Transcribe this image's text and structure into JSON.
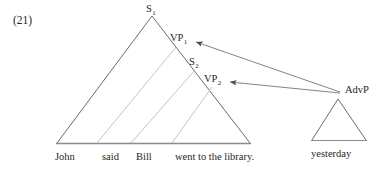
{
  "figure": {
    "example_number": "(21)",
    "colors": {
      "outline": "#5a5a5a",
      "inner_line": "#b9b9b9",
      "baseline": "#8c8c8c",
      "arrow": "#6e6e6e",
      "text": "#262626",
      "background": "#ffffff"
    }
  },
  "main_tree": {
    "nodes": [
      {
        "id": "s1",
        "base": "S",
        "subscript": "1"
      },
      {
        "id": "vp1",
        "base": "VP",
        "subscript": "1"
      },
      {
        "id": "s2",
        "base": "S",
        "subscript": "2"
      },
      {
        "id": "vp2",
        "base": "VP",
        "subscript": "2"
      }
    ],
    "terminals": [
      {
        "id": "w1",
        "text": "John"
      },
      {
        "id": "w2",
        "text": "said"
      },
      {
        "id": "w3",
        "text": "Bill"
      },
      {
        "id": "w4",
        "text": "went to the library."
      }
    ],
    "terminal_string": "John said Bill went to the library."
  },
  "adjunct_tree": {
    "node": {
      "id": "advp",
      "base": "AdvP",
      "subscript": ""
    },
    "terminal": {
      "id": "advw",
      "text": "yesterday"
    }
  },
  "attachment_arrows": [
    {
      "id": "arrow-advp-to-vp1",
      "from": "AdvP",
      "to": "VP1"
    },
    {
      "id": "arrow-advp-to-vp2",
      "from": "AdvP",
      "to": "VP2"
    }
  ]
}
